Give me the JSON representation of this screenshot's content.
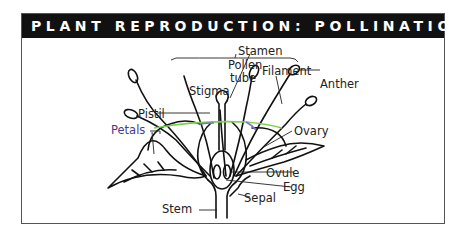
{
  "title": "PLANT REPRODUCTION: POLLINATION",
  "labels": {
    "stamen": "Stamen",
    "filament": "Filament",
    "anther": "Anther",
    "pollen_tube_1": "Pollen",
    "pollen_tube_2": "tube",
    "stigma": "Stigma",
    "pistil": "Pistil",
    "petals": "Petals",
    "ovary": "Ovary",
    "ovule": "Ovule",
    "egg": "Egg",
    "sepal": "Sepal",
    "stem": "Stem"
  },
  "colors": {
    "header_bg": "#111111",
    "header_text": "#ffffff",
    "line": "#111111",
    "ovary_outline_a": "#7bd04a",
    "ovary_outline_b": "#8a6ad8",
    "label_text": "#222222"
  }
}
